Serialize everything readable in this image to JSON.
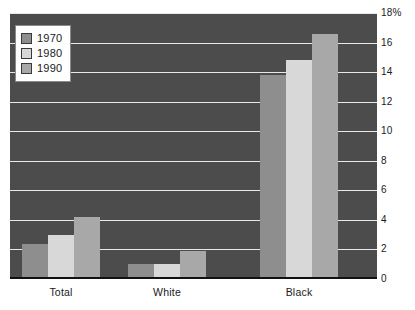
{
  "chart_data": {
    "type": "bar",
    "title": "",
    "subtitle": "",
    "xlabel": "",
    "ylabel": "",
    "categories": [
      "Total",
      "White",
      "Black"
    ],
    "series": [
      {
        "name": "1970",
        "values": [
          2.4,
          1.0,
          13.8
        ],
        "color": "#8e8e8e"
      },
      {
        "name": "1980",
        "values": [
          3.0,
          1.0,
          14.8
        ],
        "color": "#d8d8d8"
      },
      {
        "name": "1990",
        "values": [
          4.2,
          1.9,
          16.6
        ],
        "color": "#a8a8a8"
      }
    ],
    "ylim": [
      0,
      18
    ],
    "ytick_step": 2,
    "ytick_labels": [
      "18%",
      "16",
      "14",
      "12",
      "10",
      "8",
      "6",
      "4",
      "2",
      "0"
    ],
    "ytick_values": [
      18,
      16,
      14,
      12,
      10,
      8,
      6,
      4,
      2,
      0
    ],
    "grid": true,
    "grid_axis": "y",
    "legend_position": "top-left",
    "plot_background": "#4c4c4c",
    "gridline_color": "#e8e8e8",
    "axis_line_color": "#111111",
    "figure_background": "#ffffff"
  },
  "legend": {
    "items": [
      {
        "label": "1970",
        "color": "#8e8e8e"
      },
      {
        "label": "1980",
        "color": "#d8d8d8"
      },
      {
        "label": "1990",
        "color": "#a8a8a8"
      }
    ]
  },
  "axes": {
    "y": {
      "ticks": [
        {
          "label": "18%",
          "value": 18
        },
        {
          "label": "16",
          "value": 16
        },
        {
          "label": "14",
          "value": 14
        },
        {
          "label": "12",
          "value": 12
        },
        {
          "label": "10",
          "value": 10
        },
        {
          "label": "8",
          "value": 8
        },
        {
          "label": "6",
          "value": 6
        },
        {
          "label": "4",
          "value": 4
        },
        {
          "label": "2",
          "value": 2
        },
        {
          "label": "0",
          "value": 0
        }
      ]
    },
    "x": {
      "ticks": [
        {
          "label": "Total"
        },
        {
          "label": "White"
        },
        {
          "label": "Black"
        }
      ]
    }
  }
}
